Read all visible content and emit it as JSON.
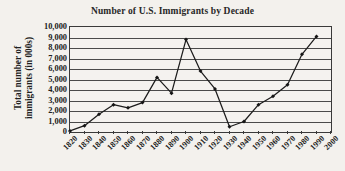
{
  "chart_data": {
    "type": "line",
    "title": "Number of U.S. Immigrants by Decade",
    "xlabel": "",
    "ylabel": "Total number of immigrants (in 000s)",
    "ylabel_lines": [
      "Total number of",
      "immigrants (in 000s)"
    ],
    "categories": [
      "1820",
      "1830",
      "1840",
      "1850",
      "1860",
      "1870",
      "1880",
      "1890",
      "1900",
      "1910",
      "1920",
      "1930",
      "1940",
      "1950",
      "1960",
      "1970",
      "1980",
      "1990",
      "2000"
    ],
    "values": [
      100,
      600,
      1700,
      2600,
      2300,
      2800,
      5200,
      3700,
      8800,
      5800,
      4100,
      500,
      1000,
      2600,
      3400,
      4500,
      7400,
      9100,
      null
    ],
    "series": [
      {
        "name": "Total number of immigrants (in 000s)",
        "values": [
          100,
          600,
          1700,
          2600,
          2300,
          2800,
          5200,
          3700,
          8800,
          5800,
          4100,
          500,
          1000,
          2600,
          3400,
          4500,
          7400,
          9100,
          null
        ]
      }
    ],
    "yticks": [
      "10,000",
      "9,000",
      "8,000",
      "7,000",
      "6,000",
      "5,000",
      "4,000",
      "3,000",
      "2,000",
      "1,000",
      "0"
    ],
    "ytick_values": [
      10000,
      9000,
      8000,
      7000,
      6000,
      5000,
      4000,
      3000,
      2000,
      1000,
      0
    ],
    "ylim": [
      0,
      10000
    ],
    "xlim": [
      "1820",
      "2000"
    ],
    "grid": "horizontal",
    "legend": "none",
    "marker": "filled-diamond",
    "line_color": "#1c1c1c",
    "marker_color": "#151515",
    "grid_color": "#4a4a4a",
    "axis_color": "#3a3a3a",
    "background_color": "#f3f1ed",
    "text_color": "#1f1f1f"
  }
}
